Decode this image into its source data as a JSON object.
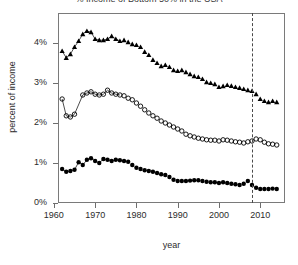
{
  "chart_data": {
    "type": "scatter",
    "title": "% Income of Bottom 50% in the USA",
    "xlabel": "year",
    "ylabel": "percent of income",
    "xlim": [
      1961,
      2016
    ],
    "ylim": [
      0,
      4.75
    ],
    "xticks": [
      1960,
      1970,
      1980,
      1990,
      2000,
      2010
    ],
    "xtick_labels": [
      "1960",
      "1970",
      "1980",
      "1990",
      "2000",
      "2010"
    ],
    "yticks": [
      0,
      1,
      2,
      3,
      4
    ],
    "ytick_labels": [
      "0%",
      "1%",
      "2%",
      "3%",
      "4%"
    ],
    "grid": false,
    "legend": "none",
    "annotations": [
      {
        "type": "vline",
        "x": 2008,
        "style": "dashed",
        "color": "#4a4a4a"
      }
    ],
    "series": [
      {
        "name": "top-series-triangles",
        "marker": "filled-triangle",
        "color": "#000000",
        "connected_early": true,
        "x": [
          1962,
          1963,
          1964,
          1965,
          1966,
          1967,
          1968,
          1969,
          1970,
          1971,
          1972,
          1973,
          1974,
          1975,
          1976,
          1977,
          1978,
          1979,
          1980,
          1981,
          1982,
          1983,
          1984,
          1985,
          1986,
          1987,
          1988,
          1989,
          1990,
          1991,
          1992,
          1993,
          1994,
          1995,
          1996,
          1997,
          1998,
          1999,
          2000,
          2001,
          2002,
          2003,
          2004,
          2005,
          2006,
          2007,
          2008,
          2009,
          2010,
          2011,
          2012,
          2013,
          2014
        ],
        "y": [
          3.8,
          3.63,
          3.72,
          3.9,
          4.05,
          4.22,
          4.3,
          4.27,
          4.1,
          4.07,
          4.07,
          4.1,
          4.17,
          4.1,
          4.05,
          4.07,
          4.02,
          3.97,
          3.95,
          3.9,
          3.78,
          3.7,
          3.58,
          3.5,
          3.42,
          3.45,
          3.4,
          3.32,
          3.3,
          3.32,
          3.27,
          3.22,
          3.17,
          3.15,
          3.1,
          3.02,
          3.0,
          2.97,
          2.9,
          2.92,
          2.95,
          2.93,
          2.9,
          2.88,
          2.85,
          2.82,
          2.8,
          2.72,
          2.6,
          2.55,
          2.52,
          2.55,
          2.52
        ]
      },
      {
        "name": "middle-series-open-circles",
        "marker": "open-circle",
        "color": "#000000",
        "connected_early": true,
        "x": [
          1962,
          1963,
          1964,
          1965,
          1967,
          1968,
          1969,
          1970,
          1971,
          1972,
          1973,
          1974,
          1975,
          1976,
          1977,
          1978,
          1979,
          1980,
          1981,
          1982,
          1983,
          1984,
          1985,
          1986,
          1987,
          1988,
          1989,
          1990,
          1991,
          1992,
          1993,
          1994,
          1995,
          1996,
          1997,
          1998,
          1999,
          2000,
          2001,
          2002,
          2003,
          2004,
          2005,
          2006,
          2007,
          2008,
          2009,
          2010,
          2011,
          2012,
          2013,
          2014
        ],
        "y": [
          2.6,
          2.18,
          2.15,
          2.22,
          2.7,
          2.75,
          2.78,
          2.72,
          2.7,
          2.72,
          2.82,
          2.75,
          2.72,
          2.7,
          2.68,
          2.62,
          2.58,
          2.5,
          2.42,
          2.33,
          2.25,
          2.18,
          2.12,
          2.05,
          2.0,
          1.95,
          1.9,
          1.85,
          1.8,
          1.72,
          1.68,
          1.65,
          1.62,
          1.6,
          1.58,
          1.57,
          1.57,
          1.55,
          1.58,
          1.57,
          1.55,
          1.53,
          1.52,
          1.5,
          1.53,
          1.55,
          1.6,
          1.58,
          1.52,
          1.48,
          1.47,
          1.45
        ]
      },
      {
        "name": "bottom-series-filled-circles",
        "marker": "filled-circle",
        "color": "#000000",
        "connected_early": true,
        "x": [
          1962,
          1963,
          1964,
          1965,
          1966,
          1967,
          1968,
          1969,
          1970,
          1971,
          1972,
          1973,
          1974,
          1975,
          1976,
          1977,
          1978,
          1979,
          1980,
          1981,
          1982,
          1983,
          1984,
          1985,
          1986,
          1987,
          1988,
          1989,
          1990,
          1991,
          1992,
          1993,
          1994,
          1995,
          1996,
          1997,
          1998,
          1999,
          2000,
          2001,
          2002,
          2003,
          2004,
          2005,
          2006,
          2007,
          2008,
          2009,
          2010,
          2011,
          2012,
          2013,
          2014
        ],
        "y": [
          0.85,
          0.78,
          0.8,
          0.83,
          1.02,
          0.95,
          1.08,
          1.12,
          1.05,
          1.0,
          1.1,
          1.08,
          1.05,
          1.08,
          1.07,
          1.05,
          1.03,
          0.95,
          0.88,
          0.85,
          0.82,
          0.8,
          0.78,
          0.75,
          0.72,
          0.7,
          0.65,
          0.58,
          0.55,
          0.55,
          0.55,
          0.56,
          0.57,
          0.57,
          0.55,
          0.53,
          0.52,
          0.52,
          0.5,
          0.52,
          0.5,
          0.48,
          0.47,
          0.45,
          0.48,
          0.55,
          0.45,
          0.38,
          0.35,
          0.35,
          0.35,
          0.36,
          0.35
        ]
      }
    ]
  }
}
